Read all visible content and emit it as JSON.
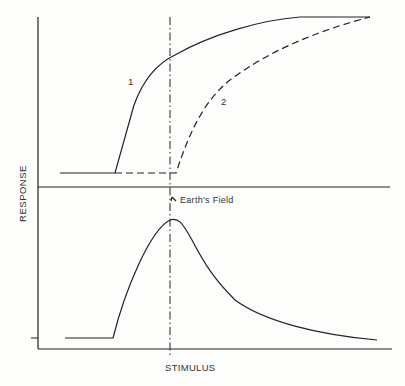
{
  "axes": {
    "ylabel": "RESPONSE",
    "xlabel": "STIMULUS"
  },
  "top_panel": {
    "curves": [
      {
        "label": "1",
        "style": "solid"
      },
      {
        "label": "2",
        "style": "dashed"
      }
    ]
  },
  "bottom_panel": {
    "annotation": "Earth's Field"
  },
  "colors": {
    "line": "#222222",
    "background": "#fdfdfb"
  }
}
